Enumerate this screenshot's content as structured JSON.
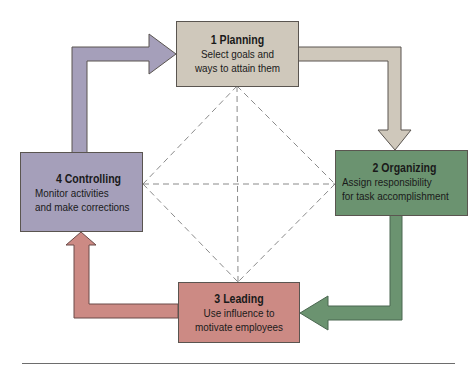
{
  "diagram": {
    "type": "management-process-cycle",
    "colors": {
      "planning": "#cfc8bb",
      "organizing": "#6b9370",
      "leading": "#cc8a84",
      "controlling": "#a59fba",
      "outline": "#5a5550",
      "dashed_lines": "#8a8a8a"
    },
    "nodes": [
      {
        "id": "planning",
        "title": "1 Planning",
        "description_lines": [
          "Select goals and",
          "ways to attain them"
        ]
      },
      {
        "id": "organizing",
        "title": "2 Organizing",
        "description_lines": [
          "Assign responsibility",
          "for task accomplishment"
        ]
      },
      {
        "id": "leading",
        "title": "3 Leading",
        "description_lines": [
          "Use influence to",
          "motivate employees"
        ]
      },
      {
        "id": "controlling",
        "title": "4 Controlling",
        "description_lines": [
          "Monitor activities",
          "and make corrections"
        ]
      }
    ],
    "edges": [
      {
        "from": "planning",
        "to": "organizing",
        "style": "solid-arrow"
      },
      {
        "from": "organizing",
        "to": "leading",
        "style": "solid-arrow"
      },
      {
        "from": "leading",
        "to": "controlling",
        "style": "solid-arrow"
      },
      {
        "from": "controlling",
        "to": "planning",
        "style": "solid-arrow"
      },
      {
        "from": "planning",
        "to": "leading",
        "style": "dashed"
      },
      {
        "from": "controlling",
        "to": "organizing",
        "style": "dashed"
      },
      {
        "from": "planning",
        "to": "organizing",
        "style": "dashed"
      },
      {
        "from": "organizing",
        "to": "leading",
        "style": "dashed"
      },
      {
        "from": "leading",
        "to": "controlling",
        "style": "dashed"
      },
      {
        "from": "controlling",
        "to": "planning",
        "style": "dashed"
      }
    ]
  }
}
